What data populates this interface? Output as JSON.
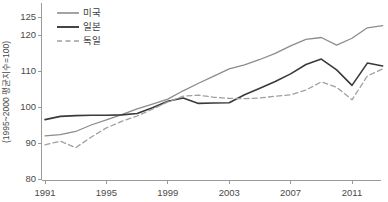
{
  "chart_data": {
    "type": "line",
    "title": "",
    "subtitle": "",
    "xlabel": "",
    "ylabel": "(1995~2000 평균지수=100)",
    "xlim": [
      1991,
      2013
    ],
    "ylim": [
      80,
      125
    ],
    "grid": false,
    "legend_position": "top-left",
    "y_ticks": [
      80,
      90,
      100,
      110,
      120,
      125
    ],
    "y_tick_labels": [
      "80",
      "90",
      "100",
      "110",
      "120",
      "125"
    ],
    "x_ticks": [
      1991,
      1995,
      1999,
      2003,
      2007,
      2011
    ],
    "x_tick_labels": [
      "1991",
      "1995",
      "1999",
      "2003",
      "2007",
      "2011"
    ],
    "x": [
      1991,
      1992,
      1993,
      1994,
      1995,
      1996,
      1997,
      1998,
      1999,
      2000,
      2001,
      2002,
      2003,
      2004,
      2005,
      2006,
      2007,
      2008,
      2009,
      2010,
      2011,
      2012,
      2013
    ],
    "series": [
      {
        "name": "미국",
        "key": "usa",
        "color": "#8c8c8c",
        "style": "solid",
        "width": 1.3,
        "values": [
          92.0,
          92.3,
          93.2,
          95.0,
          96.4,
          97.9,
          99.5,
          100.8,
          102.2,
          104.5,
          106.6,
          108.6,
          110.6,
          111.7,
          113.2,
          114.9,
          117.0,
          118.8,
          119.3,
          117.2,
          119.1,
          122.0,
          122.6
        ]
      },
      {
        "name": "일본",
        "key": "japan",
        "color": "#3a3a3a",
        "style": "solid",
        "width": 1.6,
        "values": [
          96.5,
          97.4,
          97.6,
          97.7,
          97.7,
          97.8,
          98.2,
          99.8,
          101.6,
          102.5,
          101.0,
          101.1,
          101.2,
          103.4,
          105.2,
          107.1,
          109.2,
          111.8,
          113.3,
          110.3,
          106.0,
          112.2,
          111.4
        ]
      },
      {
        "name": "독일",
        "key": "germany",
        "color": "#a0a0a0",
        "style": "dashed",
        "width": 1.3,
        "values": [
          89.5,
          90.5,
          88.7,
          91.6,
          94.2,
          96.0,
          97.5,
          99.4,
          101.4,
          103.0,
          103.3,
          102.7,
          102.4,
          102.3,
          102.5,
          103.0,
          103.4,
          104.7,
          107.0,
          105.5,
          102.0,
          108.6,
          110.6
        ]
      }
    ]
  },
  "legend": {
    "items": [
      {
        "label": "미국"
      },
      {
        "label": "일본"
      },
      {
        "label": "독일"
      }
    ]
  }
}
